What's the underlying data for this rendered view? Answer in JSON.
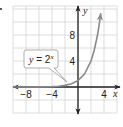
{
  "exercise": {
    "marker": "."
  },
  "chart_data": {
    "type": "line",
    "title": "",
    "function_label": "y = 2^x",
    "label_parts": {
      "lhs": "y",
      "eq": " = ",
      "base": "2",
      "exp": "x"
    },
    "xlabel": "x",
    "ylabel": "y",
    "xlim": [
      -10,
      6
    ],
    "ylim": [
      -4,
      12
    ],
    "grid": true,
    "grid_step": 2,
    "x_tick_labels": [
      {
        "value": -8,
        "text": "−8"
      },
      {
        "value": -4,
        "text": "−4"
      },
      {
        "value": 4,
        "text": "4"
      }
    ],
    "y_tick_labels": [
      {
        "value": 8,
        "text": "8"
      },
      {
        "value": 4,
        "text": "4"
      }
    ],
    "series": [
      {
        "name": "y = 2^x",
        "x": [
          -10,
          -8,
          -6,
          -4,
          -3,
          -2,
          -1,
          0,
          1,
          2,
          2.5,
          3,
          3.3,
          3.5
        ],
        "y": [
          0.001,
          0.004,
          0.016,
          0.0625,
          0.125,
          0.25,
          0.5,
          1,
          2,
          4,
          5.66,
          8,
          9.85,
          11.31
        ],
        "color": "#8a8a8a",
        "arrow_end": true,
        "arrow_start": true
      }
    ],
    "colors": {
      "grid": "#cfcfcf",
      "axis": "#222222",
      "curve": "#8a8a8a",
      "callout_border": "#999999"
    }
  }
}
